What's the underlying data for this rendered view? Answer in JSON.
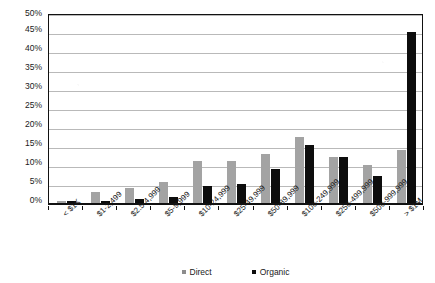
{
  "chart_data": {
    "type": "bar",
    "title": "",
    "subtitle": "",
    "xlabel": "",
    "ylabel": "",
    "ylim": [
      0,
      50
    ],
    "ytick_labels": [
      "0%",
      "5%",
      "10%",
      "15%",
      "20%",
      "25%",
      "30%",
      "35%",
      "40%",
      "45%",
      "50%"
    ],
    "ytick_values": [
      0,
      5,
      10,
      15,
      20,
      25,
      30,
      35,
      40,
      45,
      50
    ],
    "grid": true,
    "legend_position": "bottom",
    "categories": [
      "< $1K",
      "$1-2,499",
      "$2.5-4,999",
      "$5-9,999",
      "$10-24,999",
      "$25-49,999",
      "$50-89,999",
      "$100-249,999",
      "$250-499,999",
      "$500-999,999",
      "> $1M"
    ],
    "series": [
      {
        "name": "Direct",
        "color": "#a3a3a3",
        "values": [
          0.5,
          3.0,
          4.0,
          5.5,
          11.0,
          11.0,
          13.0,
          17.3,
          12.0,
          10.0,
          14.0
        ]
      },
      {
        "name": "Organic",
        "color": "#0d0d0d",
        "values": [
          0.4,
          0.5,
          1.0,
          1.5,
          4.5,
          5.0,
          9.0,
          15.2,
          12.0,
          7.0,
          45.0
        ]
      }
    ]
  },
  "legend": {
    "items": [
      {
        "label": "Direct",
        "marker": "square-marker-gray"
      },
      {
        "label": "Organic",
        "marker": "square-marker-black"
      }
    ]
  }
}
